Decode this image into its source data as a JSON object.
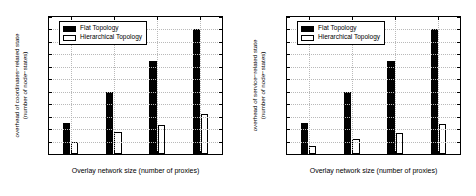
{
  "chart_data": [
    {
      "type": "bar",
      "title": "",
      "xlabel": "Overlay network size (number of proxies)",
      "ylabel": "overhead of coordinates-related state (number of node-states)",
      "ylabel_line1": "overhead of coordinates−related state",
      "ylabel_line2": "(number of node−states)",
      "categories": [
        "250",
        "500",
        "750",
        "1000"
      ],
      "series": [
        {
          "name": "Flat Topology",
          "values": [
            250,
            500,
            750,
            1000
          ],
          "color": "#000000"
        },
        {
          "name": "Hierarchical Topology",
          "values": [
            95,
            178,
            232,
            322
          ],
          "color": "#ffffff"
        }
      ],
      "ylim": [
        0,
        1100
      ],
      "ytick_step": 100,
      "yticks": [
        0,
        100,
        200,
        300,
        400,
        500,
        600,
        700,
        800,
        900,
        1000,
        1100
      ],
      "grid": true,
      "legend_position": "top-left"
    },
    {
      "type": "bar",
      "title": "",
      "xlabel": "Overlay network size (number of proxies)",
      "ylabel": "overhead of service-related state (number of node-states)",
      "ylabel_line1": "overhead of service−related state",
      "ylabel_line2": "(number of node−states)",
      "categories": [
        "250",
        "500",
        "750",
        "1000"
      ],
      "series": [
        {
          "name": "Flat Topology",
          "values": [
            250,
            500,
            750,
            1000
          ],
          "color": "#000000"
        },
        {
          "name": "Hierarchical Topology",
          "values": [
            62,
            122,
            167,
            242
          ],
          "color": "#ffffff"
        }
      ],
      "ylim": [
        0,
        1100
      ],
      "ytick_step": 100,
      "yticks": [
        0,
        100,
        200,
        300,
        400,
        500,
        600,
        700,
        800,
        900,
        1000,
        1100
      ],
      "grid": true,
      "legend_position": "top-left"
    }
  ]
}
